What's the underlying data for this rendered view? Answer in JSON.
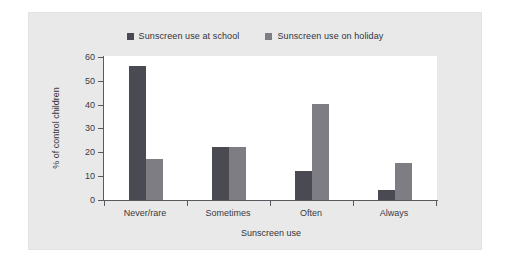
{
  "figure": {
    "background_color": "#ffffff",
    "panel_color": "#e9e9e9"
  },
  "legend": {
    "position": "top-center",
    "entries": [
      {
        "label": "Sunscreen use at school",
        "color": "#4a4a52"
      },
      {
        "label": "Sunscreen use on holiday",
        "color": "#7d7d83"
      }
    ]
  },
  "chart_data": {
    "type": "bar",
    "title": "",
    "subtitle": "",
    "xlabel": "Sunscreen use",
    "ylabel": "% of control children",
    "categories": [
      "Never/rare",
      "Sometimes",
      "Often",
      "Always"
    ],
    "series": [
      {
        "name": "Sunscreen use at school",
        "color": "#4a4a52",
        "values": [
          56,
          22,
          12,
          4
        ]
      },
      {
        "name": "Sunscreen use on holiday",
        "color": "#7d7d83",
        "values": [
          17,
          22,
          40,
          15.5
        ]
      }
    ],
    "ylim": [
      0,
      60
    ],
    "yticks": [
      0,
      10,
      20,
      30,
      40,
      50,
      60
    ],
    "ytick_labels": [
      "0",
      "10",
      "20",
      "30",
      "40",
      "50",
      "60"
    ],
    "grid": false,
    "legend_position": "top-center"
  }
}
